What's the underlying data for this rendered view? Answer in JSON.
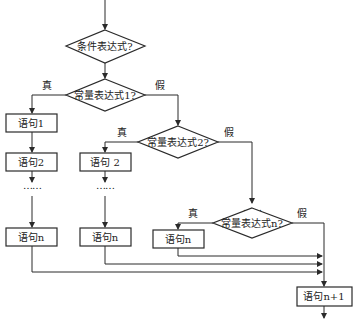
{
  "diagram": {
    "type": "flowchart",
    "decisions": {
      "condition": "条件表达式?",
      "const1": "常量表达式1?",
      "const2": "常量表达式2?",
      "constn": "常量表达式n?"
    },
    "branch_labels": {
      "true": "真",
      "false": "假"
    },
    "statements": {
      "col1_s1": "语句1",
      "col1_s2": "语句2",
      "col1_sn": "语句n",
      "col2_s2": "语句 2",
      "col2_sn": "语句n",
      "col3_sn": "语句n",
      "next": "语句n+1"
    },
    "ellipsis": "……",
    "colors": {
      "stroke": "#2a2a2a",
      "background": "#ffffff"
    }
  }
}
